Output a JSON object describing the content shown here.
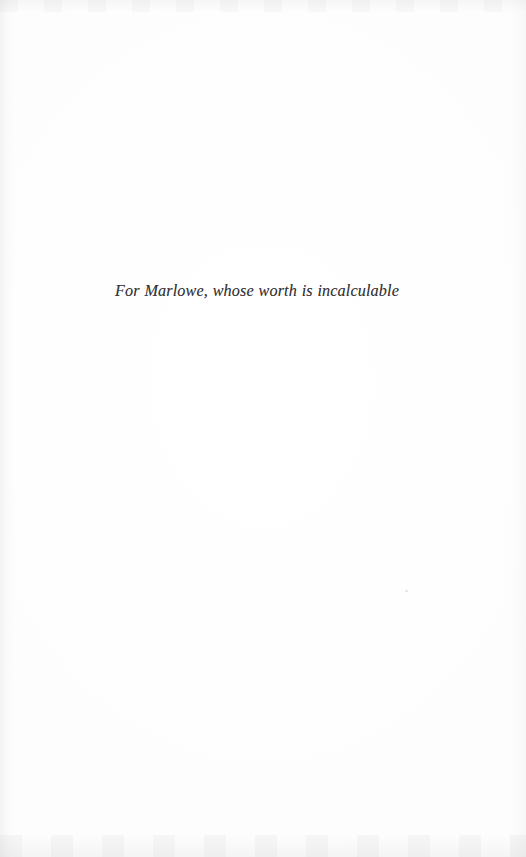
{
  "page": {
    "kind": "book-dedication-page",
    "width": 526,
    "height": 857,
    "background_color": "#fefefe",
    "ink_color": "#333336"
  },
  "dedication": {
    "text": "For Marlowe, whose worth is incalculable",
    "style": "italic-serif",
    "alignment": "center"
  },
  "artifacts": {
    "vignette_left_color": "#969696",
    "vignette_right_color": "#a0a0a0",
    "smudge_top_color": "#a5a5a8",
    "smudge_bottom_color": "#a8a8ac",
    "speck_color": "#96969b"
  }
}
